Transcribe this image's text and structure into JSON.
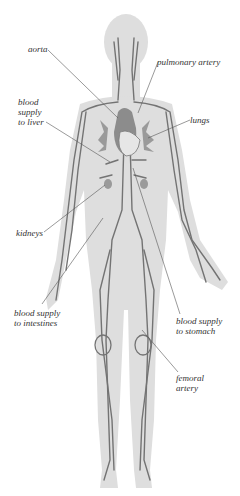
{
  "diagram": {
    "colors": {
      "body_silhouette": "#dcdcdc",
      "vessels": "#6e6e6e",
      "heart": "#8a8a8a",
      "leader_lines": "#555555",
      "label_text": "#333333",
      "background": "#ffffff"
    },
    "labels": [
      {
        "id": "aorta",
        "lines": [
          "aorta"
        ],
        "x": 28,
        "y": 44,
        "target": [
          118,
          118
        ]
      },
      {
        "id": "pulmonary-artery",
        "lines": [
          "pulmonary artery"
        ],
        "x": 157,
        "y": 57,
        "target": [
          138,
          113
        ]
      },
      {
        "id": "blood-supply-to-liver",
        "lines": [
          "blood",
          "supply",
          "to liver"
        ],
        "x": 18,
        "y": 97,
        "target": [
          110,
          162
        ]
      },
      {
        "id": "lungs",
        "lines": [
          "lungs"
        ],
        "x": 190,
        "y": 115,
        "target": [
          148,
          138
        ]
      },
      {
        "id": "kidneys",
        "lines": [
          "kidneys"
        ],
        "x": 16,
        "y": 228,
        "target": [
          105,
          185
        ]
      },
      {
        "id": "blood-supply-to-intestines",
        "lines": [
          "blood supply",
          "to intestines"
        ],
        "x": 14,
        "y": 308,
        "target": [
          103,
          218
        ]
      },
      {
        "id": "blood-supply-to-stomach",
        "lines": [
          "blood supply",
          "to stomach"
        ],
        "x": 176,
        "y": 316,
        "target": [
          133,
          168
        ]
      },
      {
        "id": "femoral-artery",
        "lines": [
          "femoral",
          "artery"
        ],
        "x": 176,
        "y": 373,
        "target": [
          142,
          330
        ]
      }
    ]
  }
}
